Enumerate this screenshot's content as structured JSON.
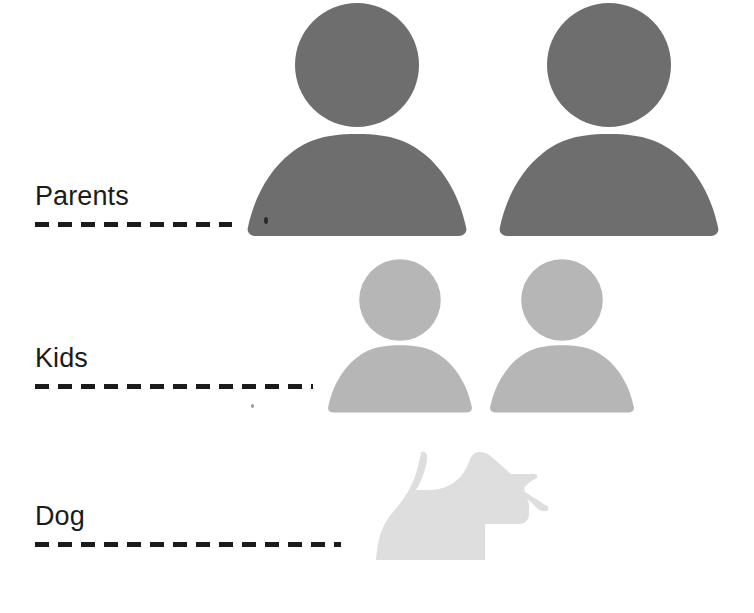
{
  "page": {
    "background_color": "#ffffff",
    "width": 754,
    "height": 613
  },
  "palette": {
    "parents_color": "#6e6e6e",
    "kids_color": "#b6b6b6",
    "dog_color": "#dedede",
    "text_color": "#1b1b1b",
    "dash_color": "#1b1b1b"
  },
  "rows": [
    {
      "id": "parents",
      "label": "Parents",
      "icon_name": "person-icon",
      "icon_count": 2,
      "icon_color": "#6e6e6e",
      "icon_scale": "large",
      "dash_width_px": 197
    },
    {
      "id": "kids",
      "label": "Kids",
      "icon_name": "person-icon",
      "icon_count": 2,
      "icon_color": "#b6b6b6",
      "icon_scale": "medium",
      "dash_width_px": 278
    },
    {
      "id": "dog",
      "label": "Dog",
      "icon_name": "scottie-dog-icon",
      "icon_count": 1,
      "icon_color": "#dedede",
      "icon_scale": "small",
      "dash_width_px": 306
    }
  ],
  "dash_style": {
    "dash_length": 14,
    "gap_length": 9,
    "thickness": 5
  }
}
